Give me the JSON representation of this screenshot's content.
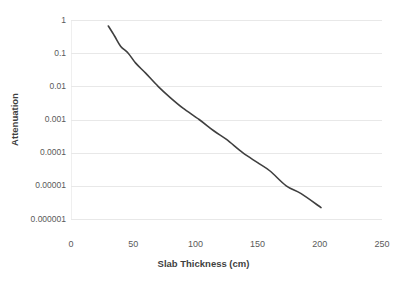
{
  "chart_data": {
    "type": "line",
    "title": "",
    "xlabel": "Slab Thickness (cm)",
    "ylabel": "Attenuation",
    "xlim": [
      0,
      250
    ],
    "ylim": [
      1e-06,
      1
    ],
    "yscale": "log",
    "xscale": "linear",
    "grid": "horizontal",
    "legend": "none",
    "xticks": [
      "0",
      "50",
      "100",
      "150",
      "200",
      "250"
    ],
    "xtick_values": [
      0,
      50,
      100,
      150,
      200,
      250
    ],
    "yticks": [
      "1",
      "0.1",
      "0.01",
      "0.001",
      "0.0001",
      "0.00001",
      "0.000001"
    ],
    "ytick_values": [
      1,
      0.1,
      0.01,
      0.001,
      0.0001,
      1e-05,
      1e-06
    ],
    "series": [
      {
        "name": "Attenuation",
        "color": "#3f3f3f",
        "linewidth": 1.6,
        "x": [
          30,
          35,
          40,
          46,
          52,
          60,
          70,
          80,
          90,
          103,
          115,
          125,
          138,
          150,
          160,
          173,
          185,
          201
        ],
        "values": [
          0.66,
          0.33,
          0.16,
          0.1,
          0.05,
          0.025,
          0.01,
          0.0045,
          0.0022,
          0.001,
          0.00045,
          0.00025,
          0.0001,
          5e-05,
          2.8e-05,
          1e-05,
          5.8e-06,
          2.2e-06
        ]
      }
    ]
  },
  "axes": {
    "x_title": "Slab Thickness (cm)",
    "y_title": "Attenuation"
  },
  "colors": {
    "series": "#3f3f3f",
    "grid": "#e8e8e8",
    "text": "#5a5a5a",
    "title_text": "#3f3f3f",
    "background": "#ffffff"
  }
}
